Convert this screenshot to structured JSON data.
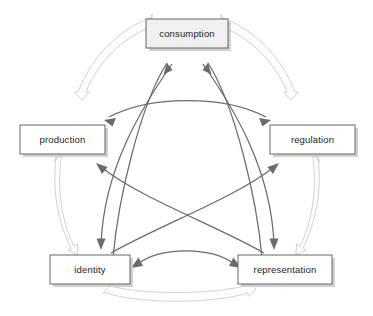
{
  "diagram": {
    "type": "cycle-diagram",
    "canvas": {
      "width": 373,
      "height": 316,
      "background": "#ffffff"
    },
    "colors": {
      "node_fill_default": "#ffffff",
      "node_fill_highlight": "#f0f0f0",
      "node_stroke": "#676767",
      "node_shadow": "#c9c9c9",
      "node_text": "#1c1c1c",
      "outer_arrow_fill": "#fdfdfd",
      "outer_arrow_stroke": "#d2d2d2",
      "inner_arrow": "#6b6b6b"
    },
    "nodes": [
      {
        "id": "consumption",
        "label": "consumption",
        "x": 186,
        "y": 33,
        "w": 82,
        "h": 29,
        "fill": "#f0f0f0",
        "highlighted": true
      },
      {
        "id": "production",
        "label": "production",
        "x": 62,
        "y": 139,
        "w": 85,
        "h": 29,
        "fill": "#ffffff",
        "highlighted": false
      },
      {
        "id": "regulation",
        "label": "regulation",
        "x": 312,
        "y": 139,
        "w": 85,
        "h": 29,
        "fill": "#ffffff",
        "highlighted": false
      },
      {
        "id": "identity",
        "label": "identity",
        "x": 90,
        "y": 269,
        "w": 80,
        "h": 29,
        "fill": "#ffffff",
        "highlighted": false
      },
      {
        "id": "representation",
        "label": "representation",
        "x": 285,
        "y": 269,
        "w": 94,
        "h": 29,
        "fill": "#ffffff",
        "highlighted": false
      }
    ],
    "outer_connections": [
      {
        "id": "production-consumption",
        "from": "production",
        "to": "consumption",
        "style": "double-headed-block-arrow",
        "color": "#d2d2d2"
      },
      {
        "id": "consumption-regulation",
        "from": "consumption",
        "to": "regulation",
        "style": "double-headed-block-arrow",
        "color": "#d2d2d2"
      },
      {
        "id": "regulation-representation",
        "from": "regulation",
        "to": "representation",
        "style": "double-headed-block-arrow",
        "color": "#d2d2d2"
      },
      {
        "id": "representation-identity",
        "from": "representation",
        "to": "identity",
        "style": "double-headed-block-arrow",
        "color": "#d2d2d2"
      },
      {
        "id": "identity-production",
        "from": "identity",
        "to": "production",
        "style": "double-headed-block-arrow",
        "color": "#d2d2d2"
      }
    ],
    "inner_connections": [
      {
        "id": "identity-consumption",
        "from": "identity",
        "to": "consumption",
        "style": "curved-single-arrow",
        "color": "#6b6b6b"
      },
      {
        "id": "representation-consumption",
        "from": "representation",
        "to": "consumption",
        "style": "curved-single-arrow",
        "color": "#6b6b6b"
      },
      {
        "id": "consumption-identity",
        "from": "consumption",
        "to": "identity",
        "style": "curved-single-arrow",
        "color": "#6b6b6b"
      },
      {
        "id": "consumption-representation",
        "from": "consumption",
        "to": "representation",
        "style": "curved-single-arrow",
        "color": "#6b6b6b"
      },
      {
        "id": "representation-production",
        "from": "representation",
        "to": "production",
        "style": "curved-single-arrow",
        "color": "#6b6b6b"
      },
      {
        "id": "identity-regulation",
        "from": "identity",
        "to": "regulation",
        "style": "curved-single-arrow",
        "color": "#6b6b6b"
      },
      {
        "id": "production-regulation",
        "from": "production",
        "to": "regulation",
        "style": "curved-double-arrow",
        "color": "#6b6b6b"
      },
      {
        "id": "identity-representation",
        "from": "identity",
        "to": "representation",
        "style": "curved-double-arrow",
        "color": "#6b6b6b"
      }
    ]
  }
}
